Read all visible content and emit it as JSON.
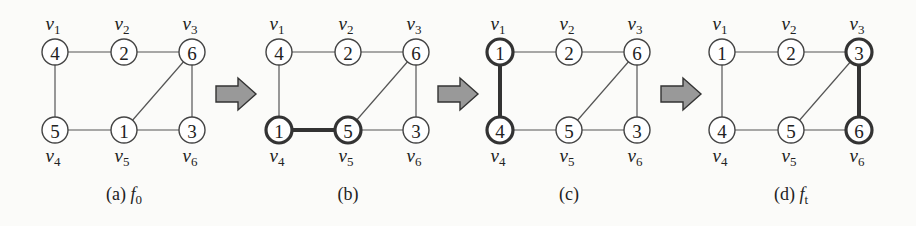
{
  "figure": {
    "panels": [
      {
        "id": "a",
        "caption": "(a) f0",
        "caption_main": "(a)",
        "caption_fn": "f",
        "caption_sub": "0",
        "ox": 0,
        "nodes": [
          {
            "id": "v1",
            "label": "v",
            "sub": "1",
            "value": "4",
            "bold": false
          },
          {
            "id": "v2",
            "label": "v",
            "sub": "2",
            "value": "2",
            "bold": false
          },
          {
            "id": "v3",
            "label": "v",
            "sub": "3",
            "value": "6",
            "bold": false
          },
          {
            "id": "v4",
            "label": "v",
            "sub": "4",
            "value": "5",
            "bold": false
          },
          {
            "id": "v5",
            "label": "v",
            "sub": "5",
            "value": "1",
            "bold": false
          },
          {
            "id": "v6",
            "label": "v",
            "sub": "6",
            "value": "3",
            "bold": false
          }
        ],
        "bold_edge": null
      },
      {
        "id": "b",
        "caption": "(b)",
        "ox": 224,
        "nodes": [
          {
            "id": "v1",
            "label": "v",
            "sub": "1",
            "value": "4",
            "bold": false
          },
          {
            "id": "v2",
            "label": "v",
            "sub": "2",
            "value": "2",
            "bold": false
          },
          {
            "id": "v3",
            "label": "v",
            "sub": "3",
            "value": "6",
            "bold": false
          },
          {
            "id": "v4",
            "label": "v",
            "sub": "4",
            "value": "1",
            "bold": true
          },
          {
            "id": "v5",
            "label": "v",
            "sub": "5",
            "value": "5",
            "bold": true
          },
          {
            "id": "v6",
            "label": "v",
            "sub": "6",
            "value": "3",
            "bold": false
          }
        ],
        "bold_edge": [
          "v4",
          "v5"
        ]
      },
      {
        "id": "c",
        "caption": "(c)",
        "ox": 445,
        "nodes": [
          {
            "id": "v1",
            "label": "v",
            "sub": "1",
            "value": "1",
            "bold": true
          },
          {
            "id": "v2",
            "label": "v",
            "sub": "2",
            "value": "2",
            "bold": false
          },
          {
            "id": "v3",
            "label": "v",
            "sub": "3",
            "value": "6",
            "bold": false
          },
          {
            "id": "v4",
            "label": "v",
            "sub": "4",
            "value": "4",
            "bold": true
          },
          {
            "id": "v5",
            "label": "v",
            "sub": "5",
            "value": "5",
            "bold": false
          },
          {
            "id": "v6",
            "label": "v",
            "sub": "6",
            "value": "3",
            "bold": false
          }
        ],
        "bold_edge": [
          "v1",
          "v4"
        ]
      },
      {
        "id": "d",
        "caption": "(d) ft",
        "caption_main": "(d)",
        "caption_fn": "f",
        "caption_sub": "t",
        "ox": 667,
        "nodes": [
          {
            "id": "v1",
            "label": "v",
            "sub": "1",
            "value": "1",
            "bold": false
          },
          {
            "id": "v2",
            "label": "v",
            "sub": "2",
            "value": "2",
            "bold": false
          },
          {
            "id": "v3",
            "label": "v",
            "sub": "3",
            "value": "3",
            "bold": true
          },
          {
            "id": "v4",
            "label": "v",
            "sub": "4",
            "value": "4",
            "bold": false
          },
          {
            "id": "v5",
            "label": "v",
            "sub": "5",
            "value": "5",
            "bold": false
          },
          {
            "id": "v6",
            "label": "v",
            "sub": "6",
            "value": "6",
            "bold": true
          }
        ],
        "bold_edge": [
          "v3",
          "v6"
        ]
      }
    ],
    "edges": [
      [
        "v1",
        "v2"
      ],
      [
        "v2",
        "v3"
      ],
      [
        "v1",
        "v4"
      ],
      [
        "v4",
        "v5"
      ],
      [
        "v5",
        "v6"
      ],
      [
        "v3",
        "v6"
      ],
      [
        "v5",
        "v3"
      ]
    ],
    "arrows": [
      {
        "id": "arrow-a-b",
        "x": 216
      },
      {
        "id": "arrow-b-c",
        "x": 438
      },
      {
        "id": "arrow-c-d",
        "x": 661
      }
    ],
    "colors": {
      "arrow_fill": "#999999",
      "stroke": "#333333",
      "background": "#fbfbf9"
    }
  }
}
